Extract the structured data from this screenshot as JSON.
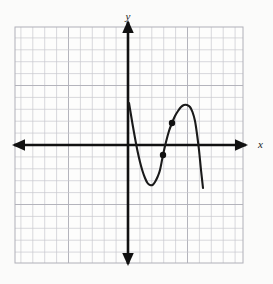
{
  "figure": {
    "title": "",
    "background_color": "#fbfbfa",
    "width": 273,
    "height": 284,
    "axis_color": "#111111",
    "grid_color": "#c9c9cf",
    "grid_major_color": "#b0b0b8",
    "curve_color": "#1a1a1a",
    "point_color": "#111111"
  },
  "labels": {
    "x_axis": "x",
    "y_axis": "y"
  },
  "chart_data": {
    "type": "line",
    "title": "",
    "xlabel": "x",
    "ylabel": "y",
    "grid": true,
    "legend": null,
    "axis_arrows": true,
    "xlim": [
      -9.4,
      10.2
    ],
    "ylim": [
      -10.2,
      9.8
    ],
    "grid_spacing": 1,
    "origin_px": [
      128,
      145
    ],
    "pixels_per_unit": 11.9,
    "series": [
      {
        "name": "curve",
        "kind": "polyline",
        "points_px": [
          [
            129,
            103
          ],
          [
            130.5,
            112
          ],
          [
            132.5,
            124
          ],
          [
            135,
            138
          ],
          [
            137.5,
            151
          ],
          [
            140,
            162
          ],
          [
            142.5,
            171
          ],
          [
            145,
            178
          ],
          [
            147.5,
            183
          ],
          [
            150,
            185
          ],
          [
            152.5,
            185
          ],
          [
            155,
            182
          ],
          [
            157.5,
            177
          ],
          [
            160,
            170
          ],
          [
            163,
            155
          ],
          [
            166,
            142
          ],
          [
            169,
            131
          ],
          [
            172,
            123
          ],
          [
            175,
            116
          ],
          [
            178,
            111
          ],
          [
            181,
            107
          ],
          [
            184,
            105
          ],
          [
            187,
            105
          ],
          [
            190,
            107
          ],
          [
            192.5,
            112
          ],
          [
            195,
            121
          ],
          [
            197,
            134
          ],
          [
            199,
            150
          ],
          [
            201,
            170
          ],
          [
            203,
            188
          ]
        ],
        "local_minimum_px": [
          150,
          185
        ],
        "local_maximum_px": [
          187,
          105
        ],
        "start_px": [
          129,
          103
        ],
        "end_px": [
          203,
          188
        ]
      }
    ],
    "marked_points": [
      {
        "name": "point-lower",
        "px": [
          163,
          155
        ],
        "radius_px": 3.2
      },
      {
        "name": "point-upper",
        "px": [
          172,
          123
        ],
        "radius_px": 3.2
      }
    ],
    "grid_rect_px": {
      "x": 15,
      "y": 27,
      "width": 228,
      "height": 236
    },
    "x_axis_px": {
      "y": 145,
      "x_start": 10,
      "x_end": 250
    },
    "y_axis_px": {
      "x": 128,
      "y_start": 18,
      "y_end": 268
    },
    "x_label_px": [
      258,
      148
    ],
    "y_label_px": [
      128,
      20
    ]
  }
}
